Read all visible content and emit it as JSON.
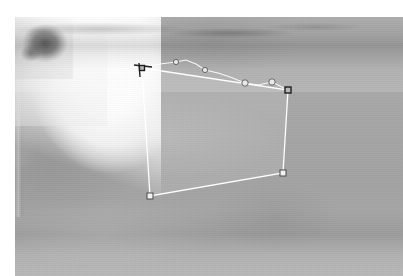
{
  "canvas": {
    "width": 403,
    "height": 276,
    "background_color": "#ffffff",
    "label": "image-editor-canvas"
  },
  "photo": {
    "name": "grayscale-photograph",
    "description": "Blurred black-and-white photograph of a figure in light clothing standing on grassy ground",
    "frame": {
      "x": 15,
      "y": 17,
      "width": 388,
      "height": 259
    },
    "dominant_color": "#a8a8a8",
    "highlight_color": "#ffffff",
    "shadow_color": "#3c3c3c"
  },
  "selection": {
    "name": "polygon-selection",
    "tool": "polygon-lasso",
    "stroke_color": "#ffffff",
    "fill_color": "rgba(255,255,255,0.10)",
    "vertices": [
      {
        "label": "top-left",
        "x": 142,
        "y": 68
      },
      {
        "label": "top-right",
        "x": 288,
        "y": 90
      },
      {
        "label": "bottom-right",
        "x": 283,
        "y": 173
      },
      {
        "label": "bottom-left",
        "x": 150,
        "y": 196
      }
    ],
    "corner_handles": [
      {
        "name": "handle-top-left",
        "x": 142,
        "y": 68,
        "shape": "square",
        "style": "dark",
        "size": 5
      },
      {
        "name": "handle-top-right",
        "x": 288,
        "y": 90,
        "shape": "square",
        "style": "dark",
        "size": 6
      },
      {
        "name": "handle-bottom-right",
        "x": 283,
        "y": 173,
        "shape": "square",
        "style": "white",
        "size": 6
      },
      {
        "name": "handle-bottom-left",
        "x": 150,
        "y": 196,
        "shape": "square",
        "style": "white",
        "size": 6
      }
    ],
    "edge_control_points": [
      {
        "name": "control-point-1",
        "x": 176,
        "y": 62,
        "shape": "circle",
        "radius": 2.6
      },
      {
        "name": "control-point-2",
        "x": 205,
        "y": 70,
        "shape": "circle",
        "radius": 2.6
      },
      {
        "name": "control-point-3",
        "x": 245,
        "y": 83,
        "shape": "circle",
        "radius": 3.2
      },
      {
        "name": "control-point-4",
        "x": 272,
        "y": 82,
        "shape": "circle",
        "radius": 3.2
      }
    ],
    "tangent_handle": {
      "name": "tangent-handle-top-left",
      "from_x": 134,
      "from_y": 65,
      "to_x": 152,
      "to_y": 67,
      "color": "#202020"
    },
    "traced_edge": {
      "name": "traced-contour",
      "points": "142,68 160,64 176,62 186,60 196,64 205,70 218,73 230,77 240,81 245,83 258,85 272,82 288,90"
    }
  },
  "scene_elements": [
    {
      "name": "garment-highlight",
      "description": "bright white clothing area",
      "color": "#ffffff"
    },
    {
      "name": "ground-band",
      "description": "darker horizontal ground band",
      "color": "#8d8d8d"
    },
    {
      "name": "shadow-patch",
      "description": "dark shadow patch lower right",
      "color": "#4a4a4a"
    },
    {
      "name": "vertical-post",
      "description": "faint vertical edge inside selection",
      "color": "#bdbdbd"
    }
  ]
}
